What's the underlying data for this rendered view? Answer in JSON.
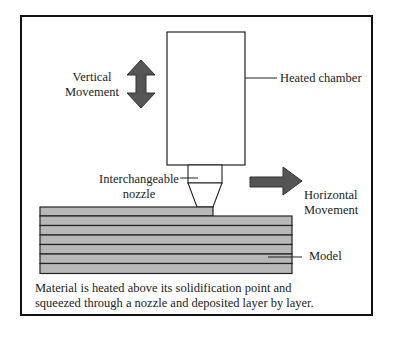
{
  "diagram": {
    "labels": {
      "vertical_movement": [
        "Vertical",
        "Movement"
      ],
      "heated_chamber": "Heated chamber",
      "nozzle": [
        "Interchangeable",
        "nozzle"
      ],
      "horizontal_movement": [
        "Horizontal",
        "Movement"
      ],
      "model": "Model"
    },
    "caption": [
      "Material is heated above its solidification point and",
      "squeezed through a nozzle and deposited layer by layer."
    ],
    "colors": {
      "arrow_fill": "#555555",
      "layer_fill": "#b8b8b8",
      "outline": "#222222"
    },
    "layer_count": 8
  }
}
